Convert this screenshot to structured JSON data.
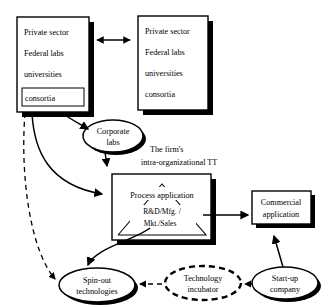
{
  "diagram": {
    "nodes": {
      "left_source_box": {
        "name": "external-sources-left",
        "lines": [
          "Private sector",
          "Federal labs",
          "universities",
          "consortia"
        ],
        "highlighted_line": "consortia"
      },
      "right_source_box": {
        "name": "external-sources-right",
        "lines": [
          "Private sector",
          "Federal labs",
          "universities",
          "consortia"
        ]
      },
      "corporate_labs": {
        "line1": "Corporate",
        "line2": "labs"
      },
      "process_box": {
        "top_label": "Process application",
        "inner_line1": "R&D/Mfg. /",
        "inner_line2": "Mkt./Sales"
      },
      "commercial_application": {
        "line1": "Commercial",
        "line2": "application"
      },
      "spin_out": {
        "line1": "Spin-out",
        "line2": "technologies"
      },
      "technology_incubator": {
        "line1": "Technology",
        "line2": "incubator"
      },
      "start_up": {
        "line1": "Start-up",
        "line2": "company"
      }
    },
    "captions": {
      "firms_tt_line1": "The firm's",
      "firms_tt_line2": "intra-organizational TT"
    },
    "colors": {
      "stroke": "#000000",
      "fill": "#ffffff",
      "shadow": "#000000"
    }
  }
}
